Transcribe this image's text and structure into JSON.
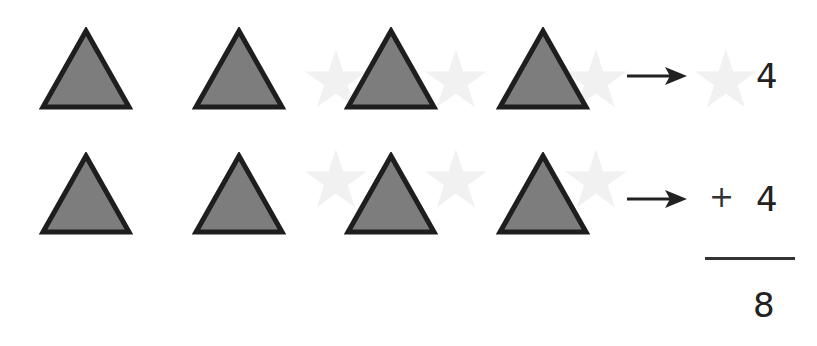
{
  "problem": {
    "shape": "triangle",
    "row1": {
      "count": 4,
      "label": "4"
    },
    "row2": {
      "count": 4,
      "operator": "+",
      "label": "4"
    },
    "sum": "8"
  },
  "colors": {
    "fill": "#7d7d7d",
    "stroke": "#1e1e1e",
    "text": "#222222"
  }
}
